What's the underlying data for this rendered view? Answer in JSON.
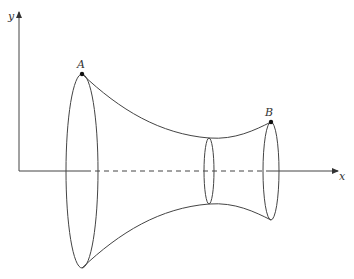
{
  "diagram": {
    "axes": {
      "x_label": "x",
      "y_label": "y"
    },
    "points": [
      {
        "label": "A",
        "x": 82,
        "y": 74
      },
      {
        "label": "B",
        "x": 271,
        "y": 122
      }
    ],
    "cross_sections": [
      {
        "name": "left-ring",
        "cx": 82,
        "cy": 171,
        "rx": 16,
        "ry": 97
      },
      {
        "name": "middle-ring",
        "cx": 209,
        "cy": 171,
        "rx": 5,
        "ry": 33
      },
      {
        "name": "right-ring",
        "cx": 271,
        "cy": 171,
        "rx": 8,
        "ry": 49
      }
    ],
    "colors": {
      "stroke": "#444444",
      "point": "#111111"
    }
  }
}
